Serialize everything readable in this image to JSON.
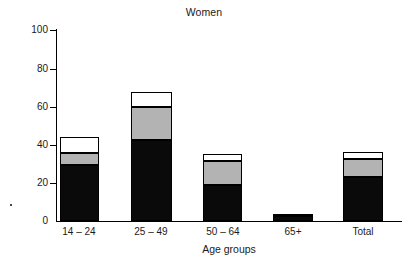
{
  "chart_data": {
    "type": "bar",
    "subtype": "stacked-bar",
    "title": "Women",
    "xlabel": "Age groups",
    "ylabel": "",
    "categories": [
      "14 – 24",
      "25 – 49",
      "50 – 64",
      "65+",
      "Total"
    ],
    "series": [
      {
        "name": "segment-1-black",
        "color": "#0a0a0a",
        "values": [
          29.5,
          42.5,
          19,
          2.5,
          23
        ]
      },
      {
        "name": "segment-2-gray",
        "color": "#b3b3b3",
        "values": [
          6,
          17,
          12.5,
          0.7,
          9.5
        ]
      },
      {
        "name": "segment-3-white",
        "color": "#ffffff",
        "values": [
          8.5,
          8,
          3.5,
          0,
          3.5
        ]
      }
    ],
    "totals": [
      44,
      67.5,
      35,
      3.2,
      36
    ],
    "ylim": [
      0,
      100
    ],
    "yticks": [
      0,
      20,
      40,
      60,
      80,
      100
    ],
    "ytick_labels": [
      "0",
      "20",
      "40",
      "60",
      "80",
      "100"
    ],
    "grid": false,
    "legend": "none"
  },
  "axis": {
    "y_tick_labels": [
      "100",
      "80",
      "60",
      "40",
      "20",
      "0"
    ],
    "x_tick_labels": [
      "14 – 24",
      "25 – 49",
      "50 – 64",
      "65+",
      "Total"
    ],
    "x_title": "Age groups"
  }
}
